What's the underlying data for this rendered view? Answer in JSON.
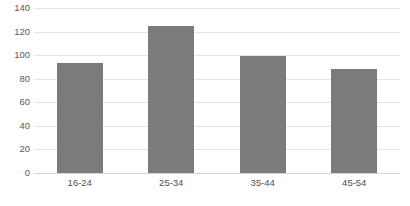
{
  "chart_data": {
    "type": "bar",
    "title": "",
    "subtitle": "",
    "xlabel": "",
    "ylabel": "",
    "categories": [
      "16-24",
      "25-34",
      "35-44",
      "45-54"
    ],
    "values": [
      93,
      125,
      99,
      88
    ],
    "series": [
      {
        "name": "",
        "values": [
          93,
          125,
          99,
          88
        ]
      }
    ],
    "ylim": [
      0,
      140
    ],
    "ytick_step": 20,
    "ytick_labels": [
      "0",
      "20",
      "40",
      "60",
      "80",
      "100",
      "120",
      "140"
    ],
    "ytick_values": [
      0,
      20,
      40,
      60,
      80,
      100,
      120,
      140
    ],
    "grid": true,
    "grid_axis": "y",
    "legend": false,
    "legend_position": "none",
    "annotations": [],
    "colors": {
      "bar": "#7b7b7b",
      "gridline": "#e4e4e4",
      "baseline": "#d4d4d4",
      "tick_text": "#5a5a5a",
      "category_text": "#4f4f4f",
      "background": "#ffffff"
    },
    "bar_width_px": 46,
    "bar_gap_px": 45
  }
}
